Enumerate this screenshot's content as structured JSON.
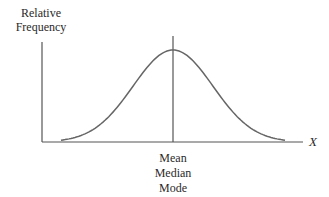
{
  "chart_data": {
    "type": "line",
    "title": "",
    "subtitle": "Symmetric (normal) distribution: mean, median, and mode coincide",
    "xlabel": "X",
    "ylabel": "Relative Frequency",
    "ylabel_lines": [
      "Relative",
      "Frequency"
    ],
    "annotations": [
      {
        "text_lines": [
          "Mean",
          "Median",
          "Mode"
        ],
        "position": "center of x-axis, below vertical line at peak"
      }
    ],
    "series": [
      {
        "name": "Normal curve",
        "x": [
          -3,
          -2.5,
          -2,
          -1.5,
          -1,
          -0.5,
          0,
          0.5,
          1,
          1.5,
          2,
          2.5,
          3
        ],
        "values": [
          0.011,
          0.044,
          0.135,
          0.325,
          0.607,
          0.882,
          1.0,
          0.882,
          0.607,
          0.325,
          0.135,
          0.044,
          0.011
        ]
      }
    ],
    "center_line": {
      "x": 0,
      "label": "Mean = Median = Mode"
    },
    "grid": false,
    "legend": "none",
    "ticks": "none"
  },
  "labels": {
    "y_line1": "Relative",
    "y_line2": "Frequency",
    "x_axis": "X",
    "center_line1": "Mean",
    "center_line2": "Median",
    "center_line3": "Mode"
  },
  "colors": {
    "axis": "#555555",
    "curve": "#666666",
    "text": "#2a2a2a"
  }
}
